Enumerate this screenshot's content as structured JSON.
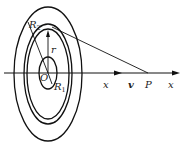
{
  "diagram": {
    "labels": {
      "R2": "R",
      "R2_sub": "2",
      "R1": "R",
      "R1_sub": "1",
      "r": "r",
      "O": "O",
      "x_mid": "x",
      "v": "v",
      "P": "P",
      "x_axis": "x"
    },
    "colors": {
      "stroke": "#111111",
      "background": "#ffffff"
    }
  }
}
